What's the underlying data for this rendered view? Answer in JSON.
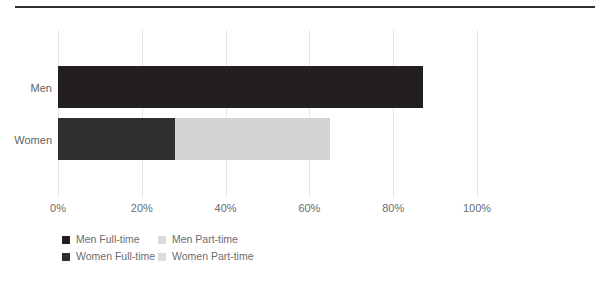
{
  "chart_data": {
    "type": "bar",
    "orientation": "horizontal",
    "stacked": true,
    "title": "",
    "subtitle": "",
    "xlabel": "",
    "ylabel": "",
    "categories": [
      "Men",
      "Women"
    ],
    "series": [
      {
        "name": "Men Full-time",
        "values": [
          87,
          null
        ],
        "color": "#231f20"
      },
      {
        "name": "Men Part-time",
        "values": [
          0,
          null
        ],
        "color": "#d9d9d9"
      },
      {
        "name": "Women Full-time",
        "values": [
          null,
          28
        ],
        "color": "#2f2f2f"
      },
      {
        "name": "Women Part-time",
        "values": [
          null,
          37
        ],
        "color": "#d4d4d4"
      }
    ],
    "bars": [
      {
        "category": "Men",
        "segments": [
          {
            "series": "Men Full-time",
            "start": 0,
            "end": 87,
            "value": 87,
            "color": "#231f20"
          }
        ],
        "total": 87
      },
      {
        "category": "Women",
        "segments": [
          {
            "series": "Women Full-time",
            "start": 0,
            "end": 28,
            "value": 28,
            "color": "#2f2f2f"
          },
          {
            "series": "Women Part-time",
            "start": 28,
            "end": 65,
            "value": 37,
            "color": "#d4d4d4"
          }
        ],
        "total": 65
      }
    ],
    "xlim": [
      0,
      100
    ],
    "xticks": [
      0,
      20,
      40,
      60,
      80,
      100
    ],
    "xticklabels": [
      "0%",
      "20%",
      "40%",
      "60%",
      "80%",
      "100%"
    ],
    "grid": {
      "vertical": true,
      "horizontal": false,
      "color": "#e6e6e6"
    },
    "legend": {
      "position": "bottom-left",
      "entries": [
        {
          "label": "Men Full-time",
          "color": "#231f20"
        },
        {
          "label": "Men Part-time",
          "color": "#d9d9d9"
        },
        {
          "label": "Women Full-time",
          "color": "#2f2f2f"
        },
        {
          "label": "Women Part-time",
          "color": "#dcdcdc"
        }
      ]
    }
  },
  "figure": {
    "top_rule_color": "#2e2e2e",
    "background": "#ffffff",
    "axis_label_color": "#6d6d6d"
  }
}
